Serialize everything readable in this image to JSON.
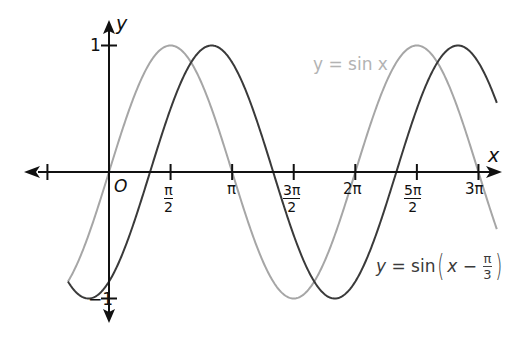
{
  "chart_data": {
    "type": "line",
    "title": "",
    "xlabel": "x",
    "ylabel": "y",
    "origin_label": "O",
    "xlim": [
      -2.2,
      10.0
    ],
    "ylim": [
      -1,
      1
    ],
    "x_ticks": [
      {
        "value": -1.5708,
        "label": ""
      },
      {
        "value": 1.5708,
        "num": "π",
        "den": "2"
      },
      {
        "value": 3.1416,
        "label": "π"
      },
      {
        "value": 4.7124,
        "num": "3π",
        "den": "2"
      },
      {
        "value": 6.2832,
        "label": "2π"
      },
      {
        "value": 7.854,
        "num": "5π",
        "den": "2"
      },
      {
        "value": 9.4248,
        "label": "3π"
      }
    ],
    "y_ticks": [
      {
        "value": 1,
        "label": "1"
      },
      {
        "value": -1,
        "label": "−1"
      }
    ],
    "series": [
      {
        "name": "y = sin x",
        "function": "sin(x)",
        "phase_shift": 0,
        "x_range": [
          -1.047,
          9.9
        ],
        "color": "#a6a6a6"
      },
      {
        "name": "y = sin(x − π/3)",
        "function": "sin(x - pi/3)",
        "phase_shift": 1.0472,
        "x_range": [
          -1.047,
          9.9
        ],
        "color": "#3a3a3a"
      }
    ],
    "grid": false,
    "legend": "inline labels"
  },
  "labels": {
    "y_axis": "y",
    "x_axis": "x",
    "origin": "O",
    "y_one": "1",
    "y_neg_one": "−1",
    "pi": "π",
    "two_pi": "2π",
    "three_pi": "3π",
    "half_num": "π",
    "half_den": "2",
    "three_half_num": "3π",
    "three_half_den": "2",
    "five_half_num": "5π",
    "five_half_den": "2",
    "sin_label": "y = sin x",
    "shift_label_prefix_y": "y",
    "shift_label_eq": " = sin",
    "shift_label_open": "(",
    "shift_label_x": "x",
    "shift_label_minus": " − ",
    "shift_label_frac_num": "π",
    "shift_label_frac_den": "3",
    "shift_label_close": ")"
  },
  "colors": {
    "axis": "#111111",
    "sin": "#a6a6a6",
    "shifted": "#3a3a3a",
    "sin_label": "#b3b3b3",
    "shifted_label": "#3a3a3a"
  }
}
